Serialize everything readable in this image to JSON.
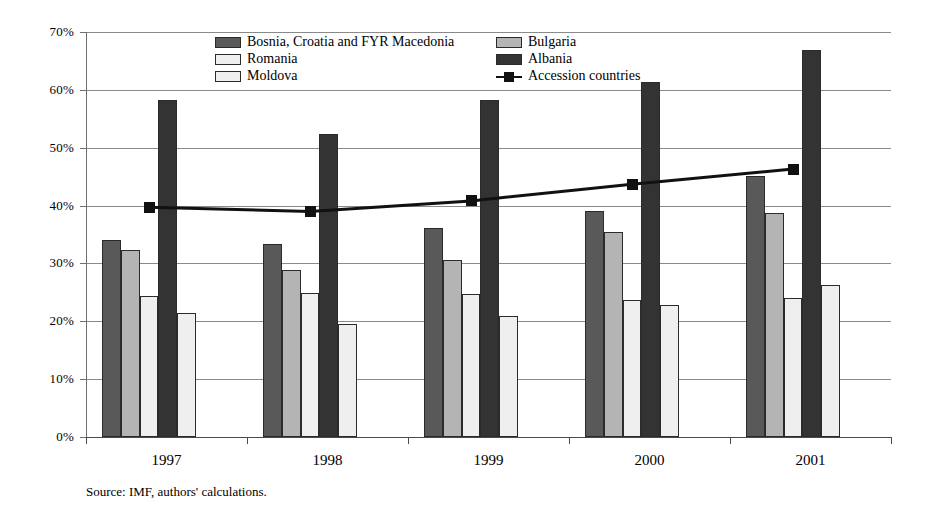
{
  "chart_data": {
    "type": "bar",
    "title": "",
    "subtitle": "",
    "xlabel": "",
    "ylabel": "",
    "categories": [
      "1997",
      "1998",
      "1999",
      "2000",
      "2001"
    ],
    "ylim": [
      0,
      70
    ],
    "ytick_labels": [
      "0%",
      "10%",
      "20%",
      "30%",
      "40%",
      "50%",
      "60%",
      "70%"
    ],
    "ytick_values": [
      0,
      10,
      20,
      30,
      40,
      50,
      60,
      70
    ],
    "grid": true,
    "legend_position": "top-inside",
    "series": [
      {
        "name": "Bosnia, Croatia and FYR Macedonia",
        "type": "bar",
        "color": "#595959",
        "values": [
          34.0,
          33.3,
          36.2,
          39.1,
          45.1
        ]
      },
      {
        "name": "Bulgaria",
        "type": "bar",
        "color": "#b4b4b4",
        "values": [
          32.4,
          28.9,
          30.6,
          35.5,
          38.7
        ]
      },
      {
        "name": "Romania",
        "type": "bar",
        "color": "#efefef",
        "values": [
          24.4,
          24.9,
          24.8,
          23.6,
          24.0
        ]
      },
      {
        "name": "Albania",
        "type": "bar",
        "color": "#333333",
        "values": [
          58.2,
          52.3,
          58.3,
          61.4,
          66.9
        ]
      },
      {
        "name": "Moldova",
        "type": "bar",
        "color": "#efefef",
        "values": [
          21.5,
          19.5,
          20.9,
          22.8,
          26.2
        ]
      },
      {
        "name": "Accession countries",
        "type": "line",
        "color": "#111111",
        "marker": "square",
        "values": [
          39.7,
          39.0,
          40.8,
          43.7,
          46.3
        ]
      }
    ]
  },
  "legend": {
    "left_column": [
      {
        "label": "Bosnia, Croatia and FYR Macedonia",
        "swatch": "s0"
      },
      {
        "label": "Romania",
        "swatch": "s2"
      },
      {
        "label": "Moldova",
        "swatch": "s2"
      }
    ],
    "right_column": [
      {
        "label": "Bulgaria",
        "swatch": "s1"
      },
      {
        "label": "Albania",
        "swatch": "s3"
      },
      {
        "label": "Accession countries",
        "swatch": "line"
      }
    ]
  },
  "source_note": "Source: IMF, authors' calculations."
}
